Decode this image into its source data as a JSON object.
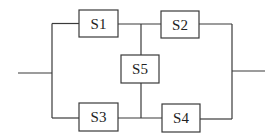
{
  "diagram": {
    "type": "reliability-block-diagram",
    "colors": {
      "line": "#3a3a3a",
      "text": "#222222",
      "background": "#ffffff"
    },
    "components": [
      {
        "id": "S1",
        "label": "S1",
        "x": 79,
        "y": 10,
        "w": 39,
        "h": 27
      },
      {
        "id": "S2",
        "label": "S2",
        "x": 161,
        "y": 11,
        "w": 38,
        "h": 27
      },
      {
        "id": "S5",
        "label": "S5",
        "x": 121,
        "y": 55,
        "w": 38,
        "h": 28
      },
      {
        "id": "S3",
        "label": "S3",
        "x": 79,
        "y": 103,
        "w": 39,
        "h": 28
      },
      {
        "id": "S4",
        "label": "S4",
        "x": 162,
        "y": 104,
        "w": 38,
        "h": 28
      }
    ],
    "connections": [
      {
        "from": "input",
        "to": "S1"
      },
      {
        "from": "input",
        "to": "S3"
      },
      {
        "from": "S1",
        "to": "S2"
      },
      {
        "from": "S3",
        "to": "S4"
      },
      {
        "from": "S1-S2 junction",
        "to": "S5"
      },
      {
        "from": "S5",
        "to": "S3-S4 junction"
      },
      {
        "from": "S2",
        "to": "output"
      },
      {
        "from": "S4",
        "to": "output"
      }
    ]
  }
}
